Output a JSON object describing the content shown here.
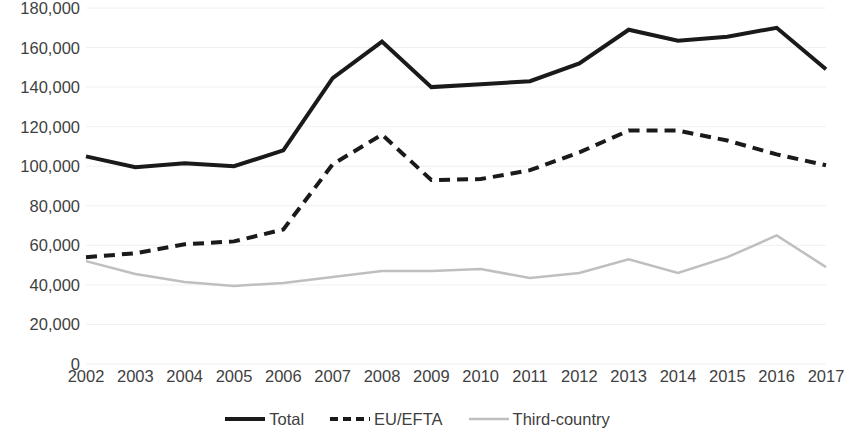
{
  "chart_data": {
    "type": "line",
    "title": "",
    "subtitle": "",
    "xlabel": "",
    "ylabel": "",
    "grid": true,
    "legend_position": "bottom",
    "categories": [
      "2002",
      "2003",
      "2004",
      "2005",
      "2006",
      "2007",
      "2008",
      "2009",
      "2010",
      "2011",
      "2012",
      "2013",
      "2014",
      "2015",
      "2016",
      "2017"
    ],
    "x": [
      2002,
      2003,
      2004,
      2005,
      2006,
      2007,
      2008,
      2009,
      2010,
      2011,
      2012,
      2013,
      2014,
      2015,
      2016,
      2017
    ],
    "xlim": [
      2002,
      2017
    ],
    "ylim": [
      0,
      180000
    ],
    "ytick_labels": [
      "180,000",
      "160,000",
      "140,000",
      "120,000",
      "100,000",
      "80,000",
      "60,000",
      "40,000",
      "20,000",
      "0"
    ],
    "ytick_values": [
      180000,
      160000,
      140000,
      120000,
      100000,
      80000,
      60000,
      40000,
      20000,
      0
    ],
    "series": [
      {
        "name": "Total",
        "style": "solid",
        "color": "#1a1a1a",
        "width": 4,
        "values": [
          105000,
          99500,
          101500,
          100000,
          108000,
          144500,
          163000,
          140000,
          141500,
          143000,
          152000,
          169000,
          163500,
          165500,
          170000,
          149000
        ]
      },
      {
        "name": "EU/EFTA",
        "style": "dashed",
        "color": "#1a1a1a",
        "width": 4,
        "values": [
          54000,
          56000,
          60500,
          62000,
          68000,
          101000,
          116000,
          93000,
          93500,
          98000,
          107000,
          118000,
          118000,
          113000,
          106000,
          100500
        ]
      },
      {
        "name": "Third-country",
        "style": "solid",
        "color": "#bfbfbf",
        "width": 2.5,
        "values": [
          52000,
          45500,
          41500,
          39500,
          41000,
          44000,
          47000,
          47000,
          48000,
          43500,
          46000,
          53000,
          46000,
          54000,
          65000,
          49000
        ]
      }
    ]
  },
  "legend": {
    "items": [
      {
        "label": "Total",
        "icon": "solid-line-swatch-icon"
      },
      {
        "label": "EU/EFTA",
        "icon": "dashed-line-swatch-icon"
      },
      {
        "label": "Third-country",
        "icon": "gray-line-swatch-icon"
      }
    ]
  },
  "colors": {
    "total": "#1a1a1a",
    "eu_efta": "#1a1a1a",
    "third_country": "#bfbfbf",
    "gridline": "#f0f0f0",
    "text": "#3f3f3f",
    "background": "#ffffff"
  }
}
